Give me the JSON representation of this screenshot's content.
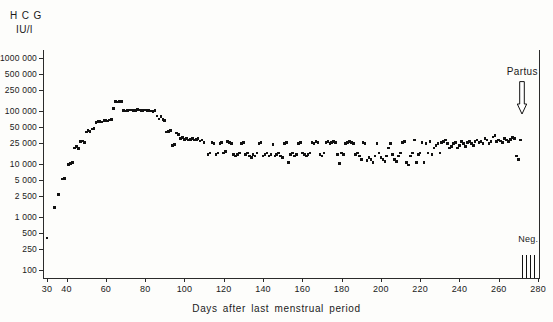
{
  "figure": {
    "y_unit_line1": "H C G",
    "y_unit_line2_prefix": "IU",
    "y_unit_line2_slash": "/",
    "y_unit_line2_suffix": "l",
    "x_title": "Days after last menstrual period",
    "partus_label": "Partus",
    "partus_icon": "down-arrow-icon",
    "neg_label": "Neg.",
    "ink_color": "#111111",
    "axis_color": "#2b2b2b",
    "background_color": "#fdfdfb"
  },
  "chart_data": {
    "type": "scatter",
    "title": "",
    "xlabel": "Days after last menstrual period",
    "ylabel": "HCG IU/l",
    "yscale": "log",
    "ylim": [
      70,
      1400000
    ],
    "xlim": [
      28,
      281
    ],
    "grid": false,
    "legend": "none",
    "ytick_values": [
      1000000,
      500000,
      250000,
      100000,
      50000,
      25000,
      10000,
      5000,
      2500,
      1000,
      500,
      250,
      100
    ],
    "ytick_labels": [
      "1000 000",
      "500 000",
      "250 000",
      "100 000",
      "50 000",
      "25 000",
      "10 000",
      "5 000",
      "2 500",
      "1 000",
      "500",
      "250",
      "100"
    ],
    "xtick_values": [
      30,
      40,
      60,
      80,
      100,
      120,
      140,
      160,
      180,
      200,
      220,
      240,
      260,
      280
    ],
    "xtick_labels": [
      "30",
      "40",
      "60",
      "80",
      "100",
      "120",
      "140",
      "160",
      "180",
      "200",
      "220",
      "240",
      "260",
      "280"
    ],
    "annotations": [
      {
        "text": "Partus",
        "x": 272,
        "y": 300000,
        "marker": "down-arrow"
      },
      {
        "text": "Neg.",
        "x": 275,
        "y": 180,
        "marker": "vertical-ticks"
      }
    ],
    "neg_tick_x": [
      272,
      274,
      276,
      278
    ],
    "x": [
      30,
      34,
      36,
      38,
      39,
      41,
      42,
      43,
      44,
      45,
      46,
      47,
      48,
      49,
      50,
      51,
      52,
      53,
      54,
      55,
      56,
      57,
      58,
      59,
      60,
      61,
      62,
      63,
      64,
      65,
      66,
      67,
      68,
      69,
      70,
      71,
      72,
      73,
      74,
      75,
      76,
      77,
      78,
      79,
      80,
      81,
      82,
      83,
      84,
      85,
      86,
      87,
      88,
      89,
      90,
      91,
      92,
      93,
      94,
      95,
      96,
      97,
      98,
      99,
      100,
      101,
      102,
      103,
      104,
      105,
      106,
      107,
      108,
      109,
      110,
      112,
      113,
      114,
      115,
      116,
      117,
      118,
      119,
      120,
      121,
      122,
      123,
      124,
      125,
      126,
      127,
      128,
      129,
      130,
      131,
      132,
      133,
      134,
      135,
      136,
      137,
      138,
      139,
      140,
      141,
      142,
      143,
      144,
      145,
      146,
      147,
      148,
      149,
      150,
      151,
      152,
      153,
      154,
      155,
      156,
      157,
      158,
      159,
      160,
      161,
      162,
      163,
      164,
      165,
      166,
      167,
      168,
      169,
      170,
      171,
      172,
      173,
      174,
      175,
      176,
      177,
      178,
      179,
      180,
      181,
      182,
      183,
      184,
      185,
      186,
      187,
      188,
      189,
      190,
      191,
      192,
      193,
      194,
      195,
      196,
      197,
      198,
      199,
      200,
      201,
      202,
      203,
      204,
      205,
      206,
      207,
      208,
      209,
      210,
      211,
      212,
      213,
      214,
      215,
      216,
      217,
      218,
      219,
      220,
      221,
      222,
      223,
      224,
      225,
      226,
      227,
      228,
      229,
      230,
      231,
      232,
      233,
      234,
      235,
      236,
      237,
      238,
      239,
      240,
      241,
      242,
      243,
      244,
      245,
      246,
      247,
      248,
      249,
      250,
      251,
      252,
      253,
      254,
      255,
      256,
      257,
      258,
      259,
      260,
      261,
      262,
      263,
      264,
      265,
      266,
      267,
      268,
      269,
      270,
      271
    ],
    "y": [
      400,
      1500,
      2600,
      5200,
      5300,
      9800,
      10200,
      10500,
      20000,
      21000,
      19500,
      26000,
      27000,
      25500,
      40000,
      42000,
      41000,
      45000,
      46000,
      60000,
      62000,
      63000,
      61000,
      65000,
      66000,
      64000,
      67000,
      68000,
      110000,
      150000,
      145000,
      148000,
      150000,
      100000,
      99000,
      102000,
      104000,
      103000,
      101000,
      100000,
      105000,
      104000,
      102000,
      100000,
      103000,
      101000,
      100000,
      99000,
      98000,
      100000,
      80000,
      70000,
      78000,
      68000,
      65000,
      40000,
      41000,
      42000,
      22000,
      23000,
      38000,
      36000,
      30000,
      31000,
      29000,
      30000,
      28000,
      29000,
      30000,
      28000,
      29000,
      30000,
      27000,
      28000,
      25000,
      15000,
      16000,
      25000,
      24000,
      15000,
      16000,
      24000,
      25000,
      16000,
      17000,
      26000,
      25000,
      24000,
      15000,
      14000,
      15000,
      16000,
      24000,
      25000,
      15000,
      16000,
      14000,
      13000,
      15000,
      14000,
      16000,
      24000,
      25000,
      14000,
      15000,
      16000,
      14000,
      15000,
      23000,
      14000,
      15000,
      16000,
      14000,
      13000,
      24000,
      25000,
      10500,
      15000,
      16000,
      14000,
      15000,
      24000,
      25000,
      16000,
      15000,
      14000,
      15000,
      16000,
      25000,
      24000,
      26000,
      25000,
      15000,
      14000,
      16000,
      25000,
      26000,
      24000,
      25000,
      26000,
      25000,
      15000,
      10000,
      16000,
      15000,
      24000,
      25000,
      26000,
      25000,
      24000,
      15000,
      16000,
      14000,
      12000,
      25000,
      24000,
      11500,
      13000,
      12000,
      10500,
      14000,
      24000,
      16000,
      13000,
      12000,
      11000,
      14000,
      20000,
      24000,
      15000,
      12000,
      11000,
      14000,
      16000,
      25000,
      26000,
      10500,
      9500,
      14000,
      16000,
      28000,
      10500,
      15000,
      16000,
      25000,
      10500,
      24000,
      16000,
      26000,
      15000,
      20000,
      22000,
      24000,
      16000,
      25000,
      26000,
      28000,
      24000,
      20000,
      21000,
      24000,
      25000,
      20000,
      22000,
      26000,
      24000,
      21000,
      25000,
      26000,
      24000,
      22000,
      26000,
      28000,
      25000,
      26000,
      24000,
      30000,
      28000,
      24000,
      26000,
      32000,
      34000,
      26000,
      28000,
      27000,
      25000,
      30000,
      28000,
      26000,
      29000,
      31000,
      30000,
      14000,
      12000,
      28000,
      30000
    ]
  }
}
